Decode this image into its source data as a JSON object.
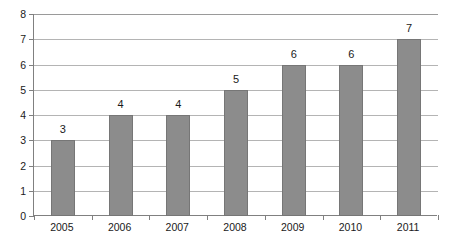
{
  "chart_data": {
    "type": "bar",
    "title": "",
    "subtitle": "",
    "xlabel": "",
    "ylabel": "",
    "categories": [
      "2005",
      "2006",
      "2007",
      "2008",
      "2009",
      "2010",
      "2011"
    ],
    "values": [
      3,
      4,
      4,
      5,
      6,
      6,
      7
    ],
    "data_labels": [
      "3",
      "4",
      "4",
      "5",
      "6",
      "6",
      "7"
    ],
    "ylim": [
      0,
      8
    ],
    "ytick_values": [
      0,
      1,
      2,
      3,
      4,
      5,
      6,
      7,
      8
    ],
    "ytick_labels": [
      "0",
      "1",
      "2",
      "3",
      "4",
      "5",
      "6",
      "7",
      "8"
    ],
    "grid": true,
    "grid_axis": "y",
    "legend": false,
    "legend_position": "none",
    "annotations": [],
    "colors": {
      "bar_fill": "#8c8c8c",
      "bar_stroke": "#767676",
      "gridline": "#b4b4b4",
      "axis": "#808080",
      "text": "#1a1a1a",
      "background": "#ffffff"
    }
  }
}
